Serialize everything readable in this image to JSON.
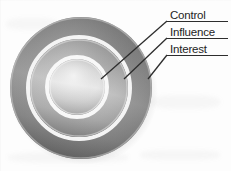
{
  "diagram": {
    "type": "concentric-circles",
    "style": "grayscale embossed 3D rings",
    "background_color": "#fdfdfd",
    "rings": [
      {
        "id": "interest",
        "label": "Interest",
        "order": 3,
        "position": "outer",
        "center_x": 81,
        "center_y": 88,
        "radius": 71,
        "fill_light": "#d8d8d8",
        "fill_dark": "#5f5f5f",
        "rim_color": "#f2f2f2"
      },
      {
        "id": "influence",
        "label": "Influence",
        "order": 2,
        "position": "middle",
        "center_x": 79,
        "center_y": 88,
        "radius": 49,
        "fill_light": "#e6e6e6",
        "fill_dark": "#7c7c7c",
        "rim_color": "#f6f6f6"
      },
      {
        "id": "control",
        "label": "Control",
        "order": 1,
        "position": "inner",
        "center_x": 77,
        "center_y": 87,
        "radius": 28,
        "fill_light": "#f2f2f2",
        "fill_dark": "#a8a8a8",
        "rim_color": "#fbfbfb"
      }
    ],
    "callouts": [
      {
        "id": "callout-control",
        "label": "Control",
        "target_ring": "control",
        "label_x": 170,
        "label_y": 9,
        "rule_x": 167,
        "rule_y": 21,
        "rule_width": 61,
        "leader_from_x": 167,
        "leader_from_y": 21,
        "leader_to_x": 101,
        "leader_to_y": 79
      },
      {
        "id": "callout-influence",
        "label": "Influence",
        "target_ring": "influence",
        "label_x": 170,
        "label_y": 26,
        "rule_x": 167,
        "rule_y": 38,
        "rule_width": 61,
        "leader_from_x": 167,
        "leader_from_y": 38,
        "leader_to_x": 124,
        "leader_to_y": 79
      },
      {
        "id": "callout-interest",
        "label": "Interest",
        "target_ring": "interest",
        "label_x": 170,
        "label_y": 43,
        "rule_x": 167,
        "rule_y": 55,
        "rule_width": 61,
        "leader_from_x": 167,
        "leader_from_y": 55,
        "leader_to_x": 148,
        "leader_to_y": 79
      }
    ],
    "leader_color": "#2d2d2d",
    "text_color": "#242424"
  }
}
